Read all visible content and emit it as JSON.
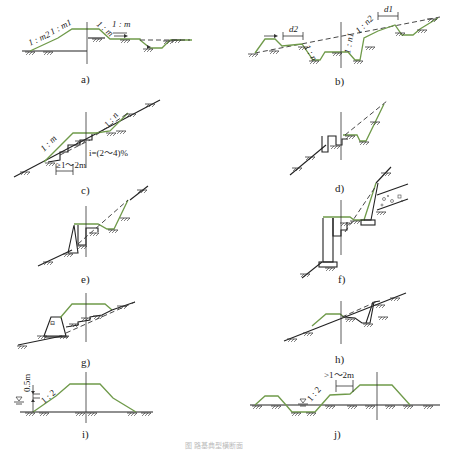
{
  "figure": {
    "caption": "图  路基典型横断面"
  },
  "panels": [
    {
      "id": "a",
      "label": "a)",
      "annotations": [
        "1 : m2",
        "1 : m1",
        "1 : m",
        "1 : m"
      ]
    },
    {
      "id": "b",
      "label": "b)",
      "annotations": [
        "d2",
        "d1",
        "1 : n",
        "1 : n1",
        "1 : n2"
      ]
    },
    {
      "id": "c",
      "label": "c)",
      "annotations": [
        "1 : m",
        "1 : n",
        "i=(2～4)%",
        "≥1～2m"
      ]
    },
    {
      "id": "d",
      "label": "d)",
      "annotations": []
    },
    {
      "id": "e",
      "label": "e)",
      "annotations": []
    },
    {
      "id": "f",
      "label": "f)",
      "annotations": []
    },
    {
      "id": "g",
      "label": "g)",
      "annotations": []
    },
    {
      "id": "h",
      "label": "h)",
      "annotations": []
    },
    {
      "id": "i",
      "label": "i)",
      "annotations": [
        "0.5m",
        "1 : 2"
      ]
    },
    {
      "id": "j",
      "label": "j)",
      "annotations": [
        ">1～2m",
        "1 : 2"
      ]
    }
  ],
  "colors": {
    "embankment_line": "#6f9a4a",
    "ground_line": "#222222"
  }
}
